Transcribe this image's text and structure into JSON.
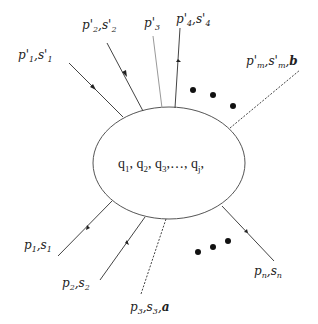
{
  "diagram": {
    "center_label": {
      "parts": [
        "q",
        "1",
        ", q",
        "2",
        ", q",
        "3",
        ",…, q",
        "j",
        ","
      ]
    },
    "outgoing": [
      {
        "p": "p'",
        "pi": "1",
        "s": "s'",
        "si": "1",
        "extra": ""
      },
      {
        "p": "p'",
        "pi": "2",
        "s": "s'",
        "si": "2",
        "extra": ""
      },
      {
        "p": "p'",
        "pi": "3",
        "s": "",
        "si": "",
        "extra": ""
      },
      {
        "p": "p'",
        "pi": "4",
        "s": "s'",
        "si": "4",
        "extra": ""
      },
      {
        "p": "p'",
        "pi": "m",
        "s": "s'",
        "si": "m",
        "extra": "b"
      }
    ],
    "incoming": [
      {
        "p": "p",
        "pi": "1",
        "s": "s",
        "si": "1",
        "extra": ""
      },
      {
        "p": "p",
        "pi": "2",
        "s": "s",
        "si": "2",
        "extra": ""
      },
      {
        "p": "p",
        "pi": "3",
        "s": "s",
        "si": "3",
        "extra": "a"
      },
      {
        "p": "p",
        "pi": "n",
        "s": "s",
        "si": "n",
        "extra": ""
      }
    ],
    "separator": ",",
    "ellipsis_dots": "• • •"
  }
}
